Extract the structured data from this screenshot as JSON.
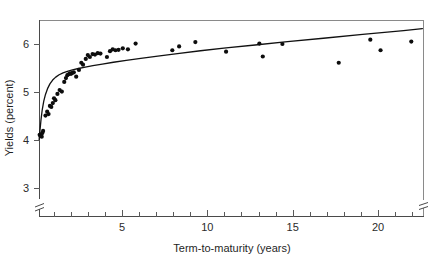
{
  "chart_data": {
    "type": "scatter",
    "title": "",
    "subtitle": "",
    "xlabel": "Term-to-maturity (years)",
    "ylabel": "Yields (percent)",
    "xlim": [
      0.0,
      22.7
    ],
    "ylim": [
      2.55,
      6.6
    ],
    "grid": false,
    "legend": "none",
    "axis_break_y": true,
    "axis_break_x_right": true,
    "x_ticks_major": [
      5,
      10,
      15,
      20
    ],
    "x_tick_labels": [
      "5",
      "10",
      "15",
      "20"
    ],
    "x_ticks_minor": [
      1,
      2,
      3,
      4,
      6,
      7,
      8,
      9,
      11,
      12,
      13,
      14,
      16,
      17,
      18,
      19,
      21,
      22
    ],
    "y_ticks_major": [
      3,
      4,
      5,
      6
    ],
    "y_tick_labels": [
      "3",
      "4",
      "5",
      "6"
    ],
    "series": [
      {
        "name": "Observed bond yields",
        "marker": "filled-circle",
        "color": "#0d0d0d",
        "points": [
          [
            0.18,
            4.12
          ],
          [
            0.22,
            4.1
          ],
          [
            0.27,
            4.13
          ],
          [
            0.3,
            4.08
          ],
          [
            0.34,
            4.16
          ],
          [
            0.38,
            4.2
          ],
          [
            0.52,
            4.52
          ],
          [
            0.62,
            4.6
          ],
          [
            0.7,
            4.55
          ],
          [
            0.78,
            4.72
          ],
          [
            0.86,
            4.7
          ],
          [
            0.95,
            4.78
          ],
          [
            1.02,
            4.88
          ],
          [
            1.1,
            4.84
          ],
          [
            1.22,
            4.97
          ],
          [
            1.35,
            5.05
          ],
          [
            1.48,
            5.02
          ],
          [
            1.62,
            5.22
          ],
          [
            1.72,
            5.3
          ],
          [
            1.8,
            5.36
          ],
          [
            1.88,
            5.38
          ],
          [
            1.95,
            5.4
          ],
          [
            2.02,
            5.39
          ],
          [
            2.1,
            5.41
          ],
          [
            2.18,
            5.42
          ],
          [
            2.32,
            5.33
          ],
          [
            2.48,
            5.47
          ],
          [
            2.62,
            5.62
          ],
          [
            2.72,
            5.58
          ],
          [
            2.88,
            5.7
          ],
          [
            3.0,
            5.78
          ],
          [
            3.12,
            5.74
          ],
          [
            3.28,
            5.8
          ],
          [
            3.42,
            5.79
          ],
          [
            3.58,
            5.82
          ],
          [
            3.74,
            5.81
          ],
          [
            4.12,
            5.74
          ],
          [
            4.3,
            5.86
          ],
          [
            4.46,
            5.9
          ],
          [
            4.62,
            5.88
          ],
          [
            4.8,
            5.89
          ],
          [
            5.05,
            5.92
          ],
          [
            5.35,
            5.9
          ],
          [
            5.8,
            6.02
          ],
          [
            7.95,
            5.88
          ],
          [
            8.35,
            5.96
          ],
          [
            9.3,
            6.05
          ],
          [
            11.1,
            5.85
          ],
          [
            13.05,
            6.02
          ],
          [
            13.25,
            5.75
          ],
          [
            14.4,
            6.01
          ],
          [
            17.7,
            5.62
          ],
          [
            19.55,
            6.1
          ],
          [
            20.15,
            5.88
          ],
          [
            21.95,
            6.06
          ]
        ]
      }
    ],
    "fit": {
      "name": "Fitted yield curve",
      "style": "solid-line",
      "color": "#111111",
      "points": [
        [
          0.15,
          4.02
        ],
        [
          0.2,
          4.22
        ],
        [
          0.26,
          4.44
        ],
        [
          0.33,
          4.64
        ],
        [
          0.42,
          4.82
        ],
        [
          0.52,
          4.96
        ],
        [
          0.64,
          5.08
        ],
        [
          0.78,
          5.18
        ],
        [
          0.94,
          5.26
        ],
        [
          1.12,
          5.32
        ],
        [
          1.32,
          5.37
        ],
        [
          1.55,
          5.41
        ],
        [
          1.8,
          5.44
        ],
        [
          2.1,
          5.47
        ],
        [
          2.45,
          5.5
        ],
        [
          2.85,
          5.53
        ],
        [
          3.3,
          5.56
        ],
        [
          3.85,
          5.59
        ],
        [
          4.5,
          5.63
        ],
        [
          5.25,
          5.67
        ],
        [
          6.1,
          5.71
        ],
        [
          7.1,
          5.76
        ],
        [
          8.25,
          5.81
        ],
        [
          9.6,
          5.87
        ],
        [
          11.1,
          5.93
        ],
        [
          12.8,
          5.99
        ],
        [
          14.7,
          6.06
        ],
        [
          16.8,
          6.13
        ],
        [
          19.1,
          6.21
        ],
        [
          21.5,
          6.29
        ],
        [
          22.6,
          6.33
        ]
      ]
    }
  },
  "axes": {
    "y_title": "Yields (percent)",
    "x_title": "Term-to-maturity (years)"
  }
}
